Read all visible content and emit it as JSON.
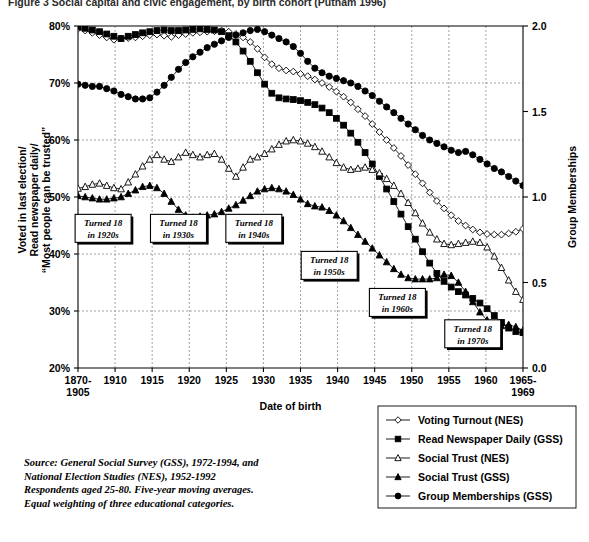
{
  "figure": {
    "title": "Figure 3   Social capital and civic engagement, by birth cohort (Putnam 1996)"
  },
  "chart_data": {
    "type": "line",
    "title": "Social capital and civic engagement, by birth cohort",
    "xlabel": "Date of birth",
    "ylabel_left": "Voted in last election/\nRead newspaper daily/\n\"Most people can be trusted\"",
    "ylabel_left_lines": [
      "Voted in last election/",
      "Read newspaper daily/",
      "“Most people can be trusted”"
    ],
    "ylabel_right": "Group Memberships",
    "grid": true,
    "legend_position": "below-right",
    "ylim_left": [
      20,
      80
    ],
    "ylim_right": [
      0.0,
      2.0
    ],
    "yticks_left": [
      "20%",
      "30%",
      "40%",
      "50%",
      "60%",
      "70%",
      "80%"
    ],
    "yticks_left_values": [
      20,
      30,
      40,
      50,
      60,
      70,
      80
    ],
    "yticks_right": [
      "0.0",
      "0.5",
      "1.0",
      "1.5",
      "2.0"
    ],
    "yticks_right_values": [
      0.0,
      0.5,
      1.0,
      1.5,
      2.0
    ],
    "categories": [
      "1870-1905",
      "1910",
      "1915",
      "1920",
      "1925",
      "1930",
      "1935",
      "1940",
      "1945",
      "1950",
      "1955",
      "1960",
      "1965-1969"
    ],
    "x_start": 1905,
    "x_end": 1967,
    "series": [
      {
        "name": "Voting Turnout (NES)",
        "marker": "open-diamond",
        "axis": "left",
        "x": [
          1905,
          1906,
          1907,
          1908,
          1909,
          1910,
          1911,
          1912,
          1913,
          1914,
          1915,
          1916,
          1917,
          1918,
          1919,
          1920,
          1921,
          1922,
          1923,
          1924,
          1925,
          1926,
          1927,
          1928,
          1929,
          1930,
          1931,
          1932,
          1933,
          1934,
          1935,
          1936,
          1937,
          1938,
          1939,
          1940,
          1941,
          1942,
          1943,
          1944,
          1945,
          1946,
          1947,
          1948,
          1949,
          1950,
          1951,
          1952,
          1953,
          1954,
          1955,
          1956,
          1957,
          1958,
          1959,
          1960,
          1961,
          1962,
          1963,
          1964,
          1965,
          1966,
          1967
        ],
        "values": [
          79.5,
          79.2,
          78.8,
          78.4,
          78.0,
          77.6,
          77.8,
          77.9,
          78.0,
          78.2,
          78.4,
          78.5,
          78.3,
          78.1,
          78.4,
          78.6,
          78.8,
          78.9,
          79.0,
          79.1,
          79.2,
          79.0,
          78.6,
          78.0,
          77.2,
          76.0,
          74.5,
          73.3,
          72.6,
          72.2,
          72.0,
          71.6,
          71.2,
          70.6,
          70.0,
          69.3,
          68.5,
          67.6,
          66.6,
          65.4,
          64.2,
          62.8,
          61.4,
          60.0,
          58.6,
          57.2,
          55.6,
          54.0,
          52.4,
          50.8,
          49.3,
          48.0,
          46.8,
          45.8,
          45.0,
          44.3,
          43.8,
          43.5,
          43.4,
          43.4,
          43.6,
          43.9,
          44.4
        ]
      },
      {
        "name": "Read Newspaper Daily (GSS)",
        "marker": "filled-square",
        "axis": "left",
        "x": [
          1905,
          1906,
          1907,
          1908,
          1909,
          1910,
          1911,
          1912,
          1913,
          1914,
          1915,
          1916,
          1917,
          1918,
          1919,
          1920,
          1921,
          1922,
          1923,
          1924,
          1925,
          1926,
          1927,
          1928,
          1929,
          1930,
          1931,
          1932,
          1933,
          1934,
          1935,
          1936,
          1937,
          1938,
          1939,
          1940,
          1941,
          1942,
          1943,
          1944,
          1945,
          1946,
          1947,
          1948,
          1949,
          1950,
          1951,
          1952,
          1953,
          1954,
          1955,
          1956,
          1957,
          1958,
          1959,
          1960,
          1961,
          1962,
          1963,
          1964,
          1965,
          1966,
          1967
        ],
        "values": [
          79.8,
          79.6,
          79.3,
          79.0,
          78.6,
          78.2,
          77.8,
          78.2,
          78.5,
          78.8,
          79.0,
          79.2,
          79.3,
          79.2,
          79.2,
          79.3,
          79.4,
          79.5,
          79.4,
          79.3,
          79.0,
          78.3,
          77.2,
          75.6,
          73.8,
          71.8,
          69.8,
          68.2,
          67.4,
          67.2,
          67.1,
          66.9,
          66.6,
          66.2,
          65.6,
          64.8,
          63.8,
          62.6,
          61.2,
          59.6,
          57.8,
          55.8,
          53.6,
          51.4,
          49.2,
          47.0,
          44.8,
          42.6,
          40.4,
          38.4,
          36.6,
          35.2,
          34.2,
          33.4,
          32.8,
          32.2,
          31.4,
          30.4,
          29.2,
          28.0,
          27.0,
          26.4,
          26.2
        ]
      },
      {
        "name": "Social Trust (NES)",
        "marker": "open-triangle",
        "axis": "left",
        "x": [
          1905,
          1906,
          1907,
          1908,
          1909,
          1910,
          1911,
          1912,
          1913,
          1914,
          1915,
          1916,
          1917,
          1918,
          1919,
          1920,
          1921,
          1922,
          1923,
          1924,
          1925,
          1926,
          1927,
          1928,
          1929,
          1930,
          1931,
          1932,
          1933,
          1934,
          1935,
          1936,
          1937,
          1938,
          1939,
          1940,
          1941,
          1942,
          1943,
          1944,
          1945,
          1946,
          1947,
          1948,
          1949,
          1950,
          1951,
          1952,
          1953,
          1954,
          1955,
          1956,
          1957,
          1958,
          1959,
          1960,
          1961,
          1962,
          1963,
          1964,
          1965,
          1966,
          1967
        ],
        "values": [
          51.5,
          51.8,
          52.2,
          52.4,
          52.0,
          51.6,
          51.4,
          52.6,
          54.0,
          55.4,
          56.6,
          57.4,
          56.6,
          56.2,
          57.0,
          57.8,
          57.4,
          57.0,
          57.4,
          57.6,
          56.6,
          55.0,
          53.6,
          55.2,
          56.6,
          57.0,
          57.6,
          58.4,
          59.2,
          59.8,
          60.0,
          59.8,
          59.4,
          58.8,
          58.0,
          57.0,
          56.0,
          55.2,
          54.8,
          55.0,
          55.2,
          54.8,
          54.2,
          53.2,
          52.0,
          50.6,
          49.0,
          47.2,
          45.4,
          43.8,
          42.6,
          41.8,
          41.6,
          41.8,
          42.0,
          42.2,
          42.0,
          41.2,
          39.6,
          37.6,
          35.4,
          33.4,
          32.0
        ]
      },
      {
        "name": "Social Trust (GSS)",
        "marker": "filled-triangle",
        "axis": "left",
        "x": [
          1905,
          1906,
          1907,
          1908,
          1909,
          1910,
          1911,
          1912,
          1913,
          1914,
          1915,
          1916,
          1917,
          1918,
          1919,
          1920,
          1921,
          1922,
          1923,
          1924,
          1925,
          1926,
          1927,
          1928,
          1929,
          1930,
          1931,
          1932,
          1933,
          1934,
          1935,
          1936,
          1937,
          1938,
          1939,
          1940,
          1941,
          1942,
          1943,
          1944,
          1945,
          1946,
          1947,
          1948,
          1949,
          1950,
          1951,
          1952,
          1953,
          1954,
          1955,
          1956,
          1957,
          1958,
          1959,
          1960,
          1961,
          1962,
          1963,
          1964,
          1965,
          1966,
          1967
        ],
        "values": [
          50.2,
          50.0,
          49.8,
          49.6,
          49.6,
          49.8,
          50.0,
          50.6,
          51.2,
          51.8,
          52.0,
          51.6,
          50.6,
          49.2,
          47.8,
          46.8,
          46.4,
          46.6,
          46.8,
          47.0,
          47.4,
          48.0,
          48.6,
          49.4,
          50.2,
          51.0,
          51.4,
          51.6,
          51.4,
          51.0,
          50.4,
          49.6,
          48.8,
          48.4,
          48.2,
          47.6,
          46.8,
          45.8,
          44.6,
          43.4,
          42.2,
          41.0,
          39.8,
          38.6,
          37.4,
          36.4,
          35.8,
          35.6,
          35.6,
          35.6,
          35.8,
          36.4,
          36.2,
          35.0,
          33.4,
          31.6,
          29.8,
          28.4,
          27.6,
          27.4,
          27.6,
          27.2,
          26.6
        ]
      },
      {
        "name": "Group Memberships (GSS)",
        "marker": "filled-circle",
        "axis": "right",
        "x": [
          1905,
          1906,
          1907,
          1908,
          1909,
          1910,
          1911,
          1912,
          1913,
          1914,
          1915,
          1916,
          1917,
          1918,
          1919,
          1920,
          1921,
          1922,
          1923,
          1924,
          1925,
          1926,
          1927,
          1928,
          1929,
          1930,
          1931,
          1932,
          1933,
          1934,
          1935,
          1936,
          1937,
          1938,
          1939,
          1940,
          1941,
          1942,
          1943,
          1944,
          1945,
          1946,
          1947,
          1948,
          1949,
          1950,
          1951,
          1952,
          1953,
          1954,
          1955,
          1956,
          1957,
          1958,
          1959,
          1960,
          1961,
          1962,
          1963,
          1964,
          1965,
          1966,
          1967
        ],
        "values_pct": [
          69.8,
          69.6,
          69.4,
          69.4,
          69.0,
          68.6,
          68.0,
          67.6,
          67.2,
          67.2,
          67.4,
          68.4,
          69.6,
          71.0,
          72.4,
          73.6,
          74.6,
          75.4,
          76.2,
          76.8,
          77.4,
          78.0,
          78.4,
          78.8,
          79.2,
          79.4,
          79.0,
          78.4,
          77.8,
          77.2,
          76.4,
          75.2,
          73.8,
          72.6,
          71.8,
          71.2,
          70.8,
          70.4,
          70.0,
          69.4,
          68.6,
          67.8,
          66.8,
          65.8,
          64.8,
          63.8,
          62.8,
          61.8,
          60.8,
          60.0,
          59.4,
          58.8,
          58.2,
          57.8,
          58.0,
          57.4,
          56.6,
          55.8,
          55.0,
          54.4,
          53.6,
          52.8,
          52.0
        ],
        "values": [
          1.66,
          1.65,
          1.65,
          1.65,
          1.63,
          1.62,
          1.6,
          1.59,
          1.57,
          1.57,
          1.58,
          1.61,
          1.65,
          1.7,
          1.75,
          1.79,
          1.82,
          1.85,
          1.87,
          1.89,
          1.91,
          1.93,
          1.95,
          1.96,
          1.97,
          1.98,
          1.97,
          1.95,
          1.93,
          1.91,
          1.88,
          1.84,
          1.79,
          1.75,
          1.73,
          1.71,
          1.69,
          1.68,
          1.67,
          1.65,
          1.62,
          1.59,
          1.56,
          1.53,
          1.49,
          1.46,
          1.43,
          1.39,
          1.36,
          1.33,
          1.31,
          1.29,
          1.27,
          1.26,
          1.27,
          1.25,
          1.22,
          1.19,
          1.17,
          1.15,
          1.12,
          1.09,
          1.07
        ]
      }
    ],
    "annotations": [
      {
        "label_line1": "Turned 18",
        "label_line2": "in 1920s",
        "x": 1908.5,
        "y_pct": 44.5
      },
      {
        "label_line1": "Turned 18",
        "label_line2": "in 1930s",
        "x": 1919.0,
        "y_pct": 44.5
      },
      {
        "label_line1": "Turned 18",
        "label_line2": "in 1940s",
        "x": 1929.5,
        "y_pct": 44.5
      },
      {
        "label_line1": "Turned 18",
        "label_line2": "in 1950s",
        "x": 1940.0,
        "y_pct": 38.0
      },
      {
        "label_line1": "Turned 18",
        "label_line2": "in 1960s",
        "x": 1949.5,
        "y_pct": 31.5
      },
      {
        "label_line1": "Turned 18",
        "label_line2": "in 1970s",
        "x": 1960.0,
        "y_pct": 26.0
      }
    ]
  },
  "legend": {
    "items": [
      {
        "label": "Voting Turnout (NES)",
        "marker": "open-diamond"
      },
      {
        "label": "Read Newspaper Daily (GSS)",
        "marker": "filled-square"
      },
      {
        "label": "Social Trust (NES)",
        "marker": "open-triangle"
      },
      {
        "label": "Social Trust (GSS)",
        "marker": "filled-triangle"
      },
      {
        "label": "Group Memberships (GSS)",
        "marker": "filled-circle"
      }
    ]
  },
  "source_note": {
    "lines": [
      "Source: General Social Survey (GSS), 1972-1994, and",
      "National Election Studies (NES), 1952-1992",
      "Respondents aged 25-80.  Five-year moving averages.",
      "Equal weighting of three educational categories."
    ]
  }
}
